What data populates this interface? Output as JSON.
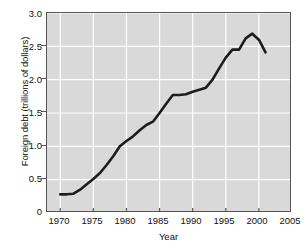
{
  "chart_data": {
    "type": "line",
    "title": "",
    "xlabel": "Year",
    "ylabel": "Foreign debt (trillions of dollars)",
    "xlim": [
      1968,
      2005
    ],
    "ylim": [
      0,
      3.0
    ],
    "grid": true,
    "legend": null,
    "xticks": [
      "1970",
      "1975",
      "1980",
      "1985",
      "1990",
      "1995",
      "2000",
      "2005"
    ],
    "xtick_values": [
      1970,
      1975,
      1980,
      1985,
      1990,
      1995,
      2000,
      2005
    ],
    "yticks": [
      "0",
      "0.5",
      "1.0",
      "1.5",
      "2.0",
      "2.5",
      "3.0"
    ],
    "ytick_values": [
      0,
      0.5,
      1.0,
      1.5,
      2.0,
      2.5,
      3.0
    ],
    "line_color": "#1c1c1c",
    "plot_background": "#d9d9d9",
    "grid_color": "#ffffff",
    "x": [
      1970,
      1971,
      1972,
      1973,
      1974,
      1975,
      1976,
      1977,
      1978,
      1979,
      1980,
      1981,
      1982,
      1983,
      1984,
      1985,
      1986,
      1987,
      1988,
      1989,
      1990,
      1991,
      1992,
      1993,
      1994,
      1995,
      1996,
      1997,
      1998,
      1999,
      2000,
      2001
    ],
    "values": [
      0.28,
      0.28,
      0.29,
      0.35,
      0.43,
      0.51,
      0.6,
      0.72,
      0.85,
      1.0,
      1.08,
      1.15,
      1.24,
      1.32,
      1.37,
      1.5,
      1.64,
      1.77,
      1.77,
      1.78,
      1.82,
      1.85,
      1.88,
      2.0,
      2.17,
      2.33,
      2.45,
      2.45,
      2.62,
      2.69,
      2.6,
      2.41
    ],
    "series": [
      {
        "name": "Foreign debt",
        "values": [
          0.28,
          0.28,
          0.29,
          0.35,
          0.43,
          0.51,
          0.6,
          0.72,
          0.85,
          1.0,
          1.08,
          1.15,
          1.24,
          1.32,
          1.37,
          1.5,
          1.64,
          1.77,
          1.77,
          1.78,
          1.82,
          1.85,
          1.88,
          2.0,
          2.17,
          2.33,
          2.45,
          2.45,
          2.62,
          2.69,
          2.6,
          2.41
        ]
      }
    ]
  }
}
